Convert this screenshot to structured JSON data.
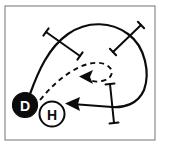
{
  "figure": {
    "frame": {
      "name": "panel-border",
      "x": 5,
      "y": 6,
      "width": 150,
      "height": 134,
      "stroke": "#8a8a8a",
      "fill": "#ffffff",
      "stroke_width": 1.2
    },
    "background": "#ffffff",
    "ink_color": "#0b0b0b"
  },
  "nodes": [
    {
      "id": "D",
      "name": "node-d",
      "label": "D",
      "style": "filled",
      "fill": "#0b0b0b",
      "text_color": "#ffffff",
      "cx": 25,
      "cy": 105,
      "r": 12.5,
      "font_size": 14
    },
    {
      "id": "H",
      "name": "node-h",
      "label": "H",
      "style": "outline",
      "fill": "#ffffff",
      "text_color": "#0b0b0b",
      "cx": 52,
      "cy": 114,
      "r": 12.5,
      "font_size": 14
    }
  ],
  "paths": {
    "solid_trajectory": {
      "name": "solid-trajectory-path",
      "stroke": "#0b0b0b",
      "stroke_width": 2.2,
      "dash": "none",
      "d": "M 30 94 C 38 72 48 48 68 34 C 88 20 112 22 128 34 C 146 47 150 74 144 90 C 138 104 124 108 112 107 L 72 104"
    },
    "solid_arrow_head": {
      "name": "solid-arrowhead",
      "points": "65,103.5 80,97 78,104 80,111",
      "fill": "#0b0b0b"
    },
    "dashed_trajectory": {
      "name": "dashed-trajectory-path",
      "stroke": "#0b0b0b",
      "stroke_width": 1.9,
      "dash": "5 4",
      "d": "M 40 100 C 50 88 60 78 74 70 C 86 63 100 60 108 66 C 115 71 112 79 102 81 C 94 83 88 80 86 76"
    },
    "dashed_arrow_head": {
      "name": "dashed-arrowhead",
      "points": "79,76.5 93,70 90,77 93,84",
      "fill": "#0b0b0b"
    }
  },
  "tick_marks": [
    {
      "name": "tick-mark-upper-left",
      "x1": 46,
      "y1": 32,
      "x2": 80,
      "y2": 56,
      "cap_len": 9,
      "stroke_width": 2.0
    },
    {
      "name": "tick-mark-upper-right",
      "x1": 141,
      "y1": 25,
      "x2": 113,
      "y2": 52,
      "cap_len": 9,
      "stroke_width": 2.0
    },
    {
      "name": "tick-mark-lower-right",
      "x1": 110,
      "y1": 84,
      "x2": 114,
      "y2": 123,
      "cap_len": 9,
      "stroke_width": 2.0
    }
  ]
}
